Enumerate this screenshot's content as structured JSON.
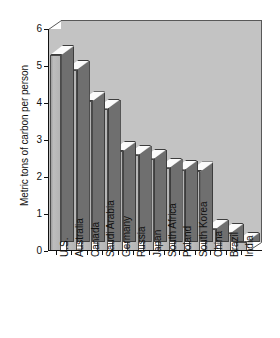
{
  "chart_data": {
    "type": "bar",
    "title": "",
    "xlabel": "",
    "ylabel": "Metric tons of carbon per person",
    "ylim": [
      0,
      6
    ],
    "yticks": [
      0,
      1,
      2,
      3,
      4,
      5,
      6
    ],
    "ytick_labels": [
      "0",
      "1",
      "2",
      "3",
      "4",
      "5",
      "6"
    ],
    "grid": false,
    "legend": false,
    "style": "3d-bar",
    "categories": [
      "U.S.",
      "Australia",
      "Canada",
      "Saudi Arabia",
      "Germany",
      "Russia",
      "Japan",
      "South Africa",
      "Poland",
      "South Korea",
      "China",
      "Brazil",
      "India"
    ],
    "values": [
      5.3,
      4.9,
      4.05,
      3.85,
      2.7,
      2.6,
      2.5,
      2.25,
      2.2,
      2.15,
      0.6,
      0.5,
      0.25
    ],
    "colors": {
      "bar_front": "#b0b0b0",
      "bar_top": "#fbfbfb",
      "bar_side": "#6f6f6f",
      "plot_background": "#c3c3c3",
      "axis": "#111111",
      "page_background": "#ffffff"
    }
  }
}
